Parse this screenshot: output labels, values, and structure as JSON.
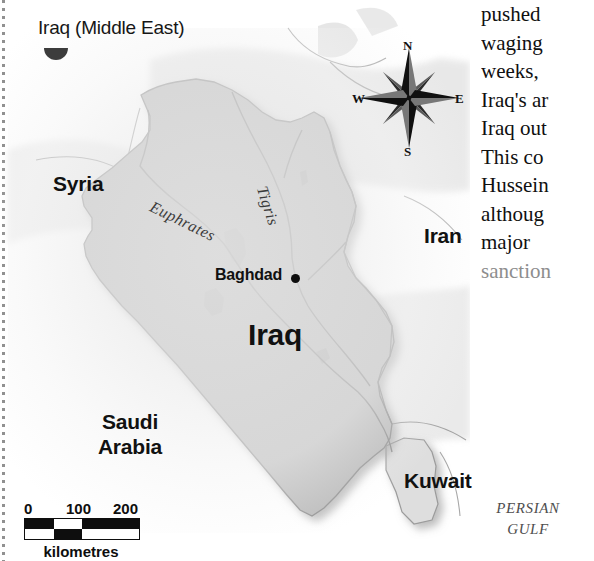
{
  "map": {
    "title": "Iraq (Middle East)",
    "inset_icon": "globe-inset-icon",
    "country_labels": {
      "syria": "Syria",
      "iran": "Iran",
      "iraq": "Iraq",
      "kuwait": "Kuwait",
      "saudi_arabia_line1": "Saudi",
      "saudi_arabia_line2": "Arabia"
    },
    "city_labels": {
      "baghdad": "Baghdad"
    },
    "river_labels": {
      "euphrates": "Euphrates",
      "tigris": "Tigris"
    },
    "water_labels": {
      "persian_gulf_line1": "PERSIAN",
      "persian_gulf_line2": "GULF"
    },
    "compass": {
      "north": "N",
      "south": "S",
      "east": "E",
      "west": "W",
      "icon": "compass-rose-icon"
    },
    "scale": {
      "ticks": [
        "0",
        "100",
        "200"
      ],
      "unit_caption": "kilometres",
      "segments": [
        "black",
        "white",
        "black",
        "white"
      ]
    },
    "colors": {
      "land_fill": "#b9b9b9",
      "land_stroke": "#8f8f8f",
      "neighbor_fill": "#dcdcdc",
      "paper": "#ffffff",
      "label_text": "#111111",
      "muted_text": "#8d8d8d",
      "gulf_text": "#4e4e4e"
    }
  },
  "text_column": {
    "lines": [
      {
        "text": "pushed",
        "muted": false
      },
      {
        "text": "waging",
        "muted": false
      },
      {
        "text": "weeks,",
        "muted": false
      },
      {
        "text": "Iraq's ar",
        "muted": false
      },
      {
        "text": "Iraq out",
        "muted": false
      },
      {
        "text": "This  co",
        "muted": false
      },
      {
        "text": "Hussein",
        "muted": false
      },
      {
        "text": "althoug",
        "muted": false
      },
      {
        "text": "major",
        "muted": false
      },
      {
        "text": "sanction",
        "muted": true
      }
    ]
  }
}
